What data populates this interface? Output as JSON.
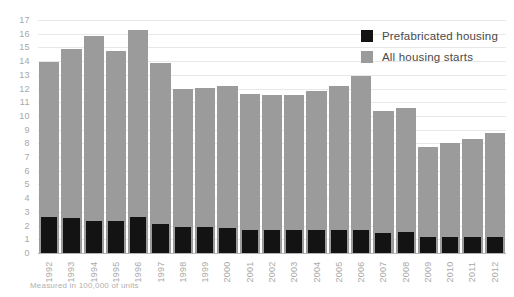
{
  "chart_data": {
    "type": "bar",
    "title": "",
    "subtitle": "",
    "xlabel": "",
    "ylabel": "",
    "ylim": [
      0,
      17
    ],
    "ytick_step": 1,
    "grid": true,
    "legend_position": "top-right",
    "footnote": "Measured in 100,000 of units",
    "categories": [
      "1992",
      "1993",
      "1994",
      "1995",
      "1996",
      "1997",
      "1998",
      "1999",
      "2000",
      "2001",
      "2002",
      "2003",
      "2004",
      "2005",
      "2006",
      "2007",
      "2008",
      "2009",
      "2010",
      "2011",
      "2012"
    ],
    "yticks": [
      "0",
      "1",
      "2",
      "3",
      "4",
      "5",
      "6",
      "7",
      "8",
      "9",
      "10",
      "11",
      "12",
      "13",
      "14",
      "15",
      "16",
      "17"
    ],
    "series": [
      {
        "name": "Prefabricated housing",
        "color": "#131313",
        "values": [
          2.6,
          2.55,
          2.35,
          2.35,
          2.6,
          2.15,
          1.9,
          1.9,
          1.8,
          1.7,
          1.7,
          1.7,
          1.7,
          1.65,
          1.65,
          1.45,
          1.5,
          1.2,
          1.15,
          1.15,
          1.2
        ]
      },
      {
        "name": "All housing starts",
        "color": "#9b9b9b",
        "values": [
          13.95,
          14.85,
          15.8,
          14.75,
          16.3,
          13.9,
          12.0,
          12.05,
          12.15,
          11.6,
          11.5,
          11.55,
          11.85,
          12.2,
          12.95,
          10.35,
          10.6,
          7.75,
          8.05,
          8.3,
          8.75
        ]
      }
    ]
  }
}
